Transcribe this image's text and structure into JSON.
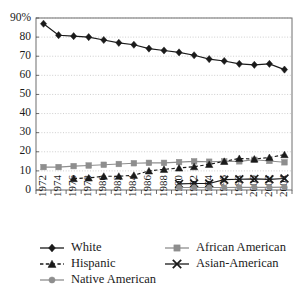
{
  "chart_data": {
    "type": "line",
    "title": "",
    "xlabel": "",
    "ylabel": "",
    "ylim": [
      0,
      90
    ],
    "grid": true,
    "legend_position": "bottom",
    "categories": [
      1972,
      1974,
      1976,
      1978,
      1980,
      1982,
      1984,
      1986,
      1988,
      1990,
      1992,
      1994,
      1996,
      1998,
      2000,
      2002,
      2004
    ],
    "x_tick_labels": [
      "1972",
      "1974",
      "1976",
      "1978",
      "1980",
      "1982",
      "1984",
      "1986",
      "1988",
      "1990",
      "1992",
      "1994",
      "1996",
      "1998",
      "2000",
      "2002",
      "2004"
    ],
    "y_tick_labels": [
      "90%",
      "80",
      "70",
      "60",
      "50",
      "40",
      "30",
      "20",
      "10",
      "0"
    ],
    "y_tick_values": [
      90,
      80,
      70,
      60,
      50,
      40,
      30,
      20,
      10,
      0
    ],
    "series": [
      {
        "name": "White",
        "marker": "diamond",
        "color": "#1a1a1a",
        "line_style": "solid",
        "start_year": 1972,
        "values": [
          87,
          81,
          80.5,
          80,
          78.5,
          77,
          76,
          74,
          73,
          72,
          70.5,
          68.5,
          67.5,
          66,
          65.5,
          66,
          63
        ]
      },
      {
        "name": "African American",
        "marker": "square",
        "color": "#8e8e8e",
        "line_style": "solid",
        "start_year": 1972,
        "values": [
          12,
          12,
          12.5,
          12.8,
          13.2,
          13.6,
          14,
          14.2,
          14.2,
          14.6,
          15,
          14.8,
          15,
          15,
          15.8,
          15.2,
          14.5
        ]
      },
      {
        "name": "Hispanic",
        "marker": "triangle",
        "color": "#1a1a1a",
        "line_style": "dashed",
        "start_year": 1976,
        "values": [
          null,
          null,
          6,
          6.3,
          7.2,
          7.2,
          7.7,
          10,
          10.8,
          11.5,
          12.2,
          13.4,
          15,
          16.5,
          16.2,
          17,
          18.5
        ]
      },
      {
        "name": "Asian-American",
        "marker": "x",
        "color": "#1a1a1a",
        "line_style": "solid",
        "start_year": 1990,
        "values": [
          null,
          null,
          null,
          null,
          null,
          null,
          null,
          null,
          null,
          3.2,
          3.4,
          3.4,
          5.4,
          5.6,
          5.8,
          5.6,
          6
        ]
      },
      {
        "name": "Native American",
        "marker": "circle",
        "color": "#8e8e8e",
        "line_style": "solid",
        "start_year": 1990,
        "values": [
          null,
          null,
          null,
          null,
          null,
          null,
          null,
          null,
          null,
          1.3,
          1.3,
          1.3,
          1.3,
          1.4,
          1.4,
          1.4,
          1.5
        ]
      }
    ],
    "legend": [
      {
        "label": "White",
        "marker": "diamond",
        "color": "#1a1a1a",
        "line_style": "solid"
      },
      {
        "label": "African American",
        "marker": "square",
        "color": "#8e8e8e",
        "line_style": "solid"
      },
      {
        "label": "Hispanic",
        "marker": "triangle",
        "color": "#1a1a1a",
        "line_style": "dashed"
      },
      {
        "label": "Asian-American",
        "marker": "x",
        "color": "#1a1a1a",
        "line_style": "solid"
      },
      {
        "label": "Native American",
        "marker": "circle",
        "color": "#8e8e8e",
        "line_style": "solid"
      }
    ]
  },
  "layout": {
    "plot_left": 36,
    "plot_right": 292,
    "plot_top": 18,
    "plot_bottom": 190,
    "legend_rows": [
      {
        "cols": [
          0,
          1
        ],
        "y": 248
      },
      {
        "cols": [
          2,
          3
        ],
        "y": 264
      },
      {
        "cols": [
          4
        ],
        "y": 280
      }
    ],
    "legend_col_x": [
      40,
      165
    ]
  }
}
